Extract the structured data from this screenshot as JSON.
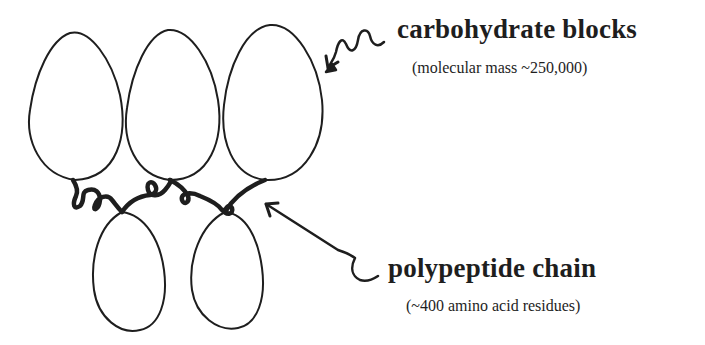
{
  "diagram": {
    "labels": {
      "carbohydrate": {
        "title": "carbohydrate blocks",
        "subtitle": "(molecular mass ~250,000)"
      },
      "polypeptide": {
        "title": "polypeptide chain",
        "subtitle": "(~400 amino acid residues)"
      }
    },
    "colors": {
      "ink": "#1e1e1e",
      "background": "#ffffff"
    }
  }
}
